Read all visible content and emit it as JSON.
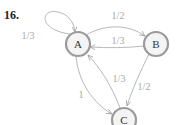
{
  "problem": {
    "number": "16."
  },
  "nodes": [
    {
      "id": "A",
      "label": "A"
    },
    {
      "id": "B",
      "label": "B"
    },
    {
      "id": "C",
      "label": "C"
    }
  ],
  "edges": [
    {
      "from": "A",
      "to": "A",
      "label": "1/3"
    },
    {
      "from": "A",
      "to": "B",
      "label": "1/2"
    },
    {
      "from": "B",
      "to": "A",
      "label": "1/3"
    },
    {
      "from": "A",
      "to": "C",
      "label": "1"
    },
    {
      "from": "C",
      "to": "A",
      "label": "1/3"
    },
    {
      "from": "B",
      "to": "C",
      "label": "1/2"
    }
  ],
  "colors": {
    "edge": "#b8b8b8",
    "node_border": "#9a9a9a",
    "node_fill": "#f4f4f4",
    "label": "#a8a8a8"
  }
}
